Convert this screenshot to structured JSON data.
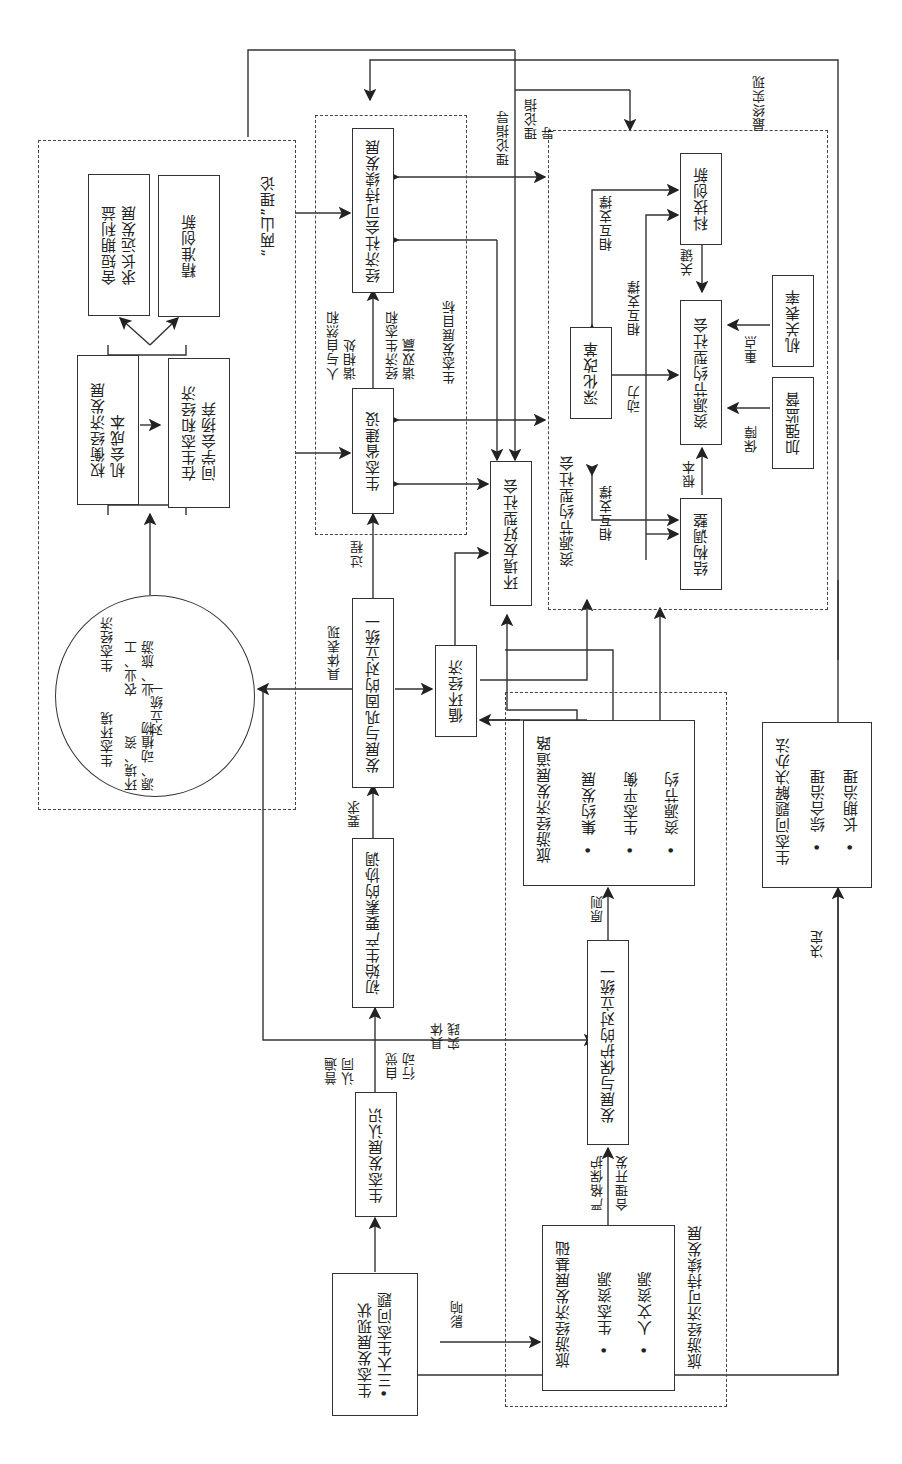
{
  "diagram": {
    "orientation": "rotated 90° counter-clockwise",
    "nodes": {
      "eco_status": {
        "title": "生态发展现状",
        "bullet": "三大生态问题"
      },
      "eco_recognition": "生态发展认识",
      "initial_factor_coordination": "初始生产要素的协调",
      "dev_consolidation_unity": "发展与巩固的对立统一",
      "circular_economy": "循环经济",
      "eco_province_building": "生态省建设",
      "econ_society_sustainable": "经济社会可持续发展",
      "env_friendly_society": "环境友好型社会",
      "weigh_opportunity_cost": {
        "line1": "权衡经济发展",
        "line2": "机会成本"
      },
      "choose_between": {
        "line1": "在生态和经济",
        "line2": "间学会扬弃"
      },
      "sacrifice_short_term": {
        "line1": "舍短期利益",
        "line2": "求长远发展"
      },
      "precise_innovation": "精准创新",
      "circle": {
        "top_title": "生态经济",
        "top_items": "农业、工业、旅游",
        "bottom_title": "生态环境",
        "bottom_items": "环境、资源、动植物",
        "axis_label": "对立统一"
      },
      "tourism_base": {
        "title": "旅游经济发展基础",
        "items": [
          "生态资源",
          "人文资源"
        ]
      },
      "dev_protection_unity": "发展与保护的对立统一",
      "tourism_path": {
        "title": "旅游经济发展道路",
        "items": [
          "集约发展",
          "生态平衡",
          "资源节约"
        ]
      },
      "deepen_reform": "深化改革",
      "tech_innovation": "科技创新",
      "resource_saving_society": "资源节约型社会",
      "structural_adjustment": "结构调整",
      "strengthen_supervision": "加强监督",
      "official_example": "机关表率",
      "eco_solution": {
        "title": "生态问题解决办法",
        "items": [
          "综合治理",
          "长期治理"
        ]
      }
    },
    "groups": {
      "two_mountains": "“两山”理论",
      "eco_dev_goal": "生态发展目标",
      "resource_saving_group": "资源节约型社会",
      "tourism_sustainable": "旅游经济可持续发展"
    },
    "edge_labels": {
      "common_recognition": "普遍认同",
      "conscious_action": "自觉行动",
      "requirement": "要求",
      "concrete_manifestation": "具体表现",
      "process": "过程",
      "human_nature_harmony": "人与自然和谐相处",
      "econ_eco_win": "经济生态和谐双赢",
      "theory_guidance_1": "理论指导",
      "theory_guidance_2": "理论指导",
      "final_realization": "最终实现",
      "influence": "影响",
      "strict_protection": "严格保护",
      "rational_development": "合理开发",
      "principle": "原则",
      "concrete_practice": "具体实践",
      "decide": "决定",
      "mutual_support_1": "相互支撑",
      "mutual_support_2": "相互支撑",
      "mutual_support_3": "相互支撑",
      "key": "关键",
      "momentum": "动力",
      "root": "根本",
      "guarantee": "保障",
      "focus": "重点"
    }
  }
}
